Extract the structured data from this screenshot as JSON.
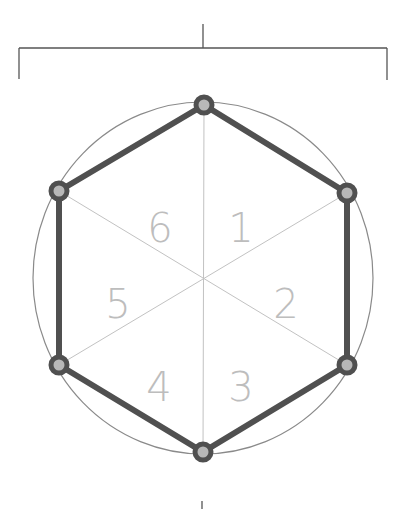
{
  "diagram": {
    "segments": [
      {
        "label": "1",
        "x": 241,
        "y": 242
      },
      {
        "label": "2",
        "x": 286,
        "y": 318
      },
      {
        "label": "3",
        "x": 241,
        "y": 400
      },
      {
        "label": "4",
        "x": 159,
        "y": 400
      },
      {
        "label": "5",
        "x": 118,
        "y": 318
      },
      {
        "label": "6",
        "x": 159,
        "y": 242
      }
    ],
    "colors": {
      "hexagon_stroke": "#505050",
      "vertex_fill": "#b8b8b8",
      "circle_stroke": "#8a8a8a",
      "spoke_stroke": "#bcbcbc",
      "label_fill": "#bdbdbd",
      "bracket_stroke": "#555555"
    }
  }
}
